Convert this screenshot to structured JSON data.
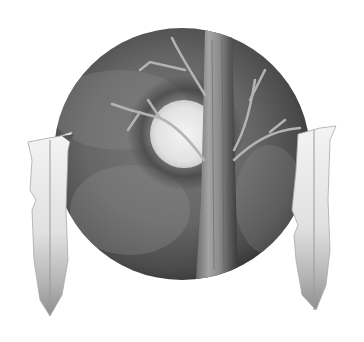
{
  "image": {
    "subject": "Pencil drawing of a circular shield with a bare tree and full moon, two feathers hanging at the sides",
    "palette": {
      "background": "#ffffff",
      "shield_dark": "#3c3c3c",
      "shield_mid": "#6e6e6e",
      "shield_light": "#9a9a9a",
      "moon": "#ececec",
      "trunk": "#8a8a8a",
      "feather": "#e6e6e6",
      "feather_shade": "#9c9c9c"
    }
  }
}
